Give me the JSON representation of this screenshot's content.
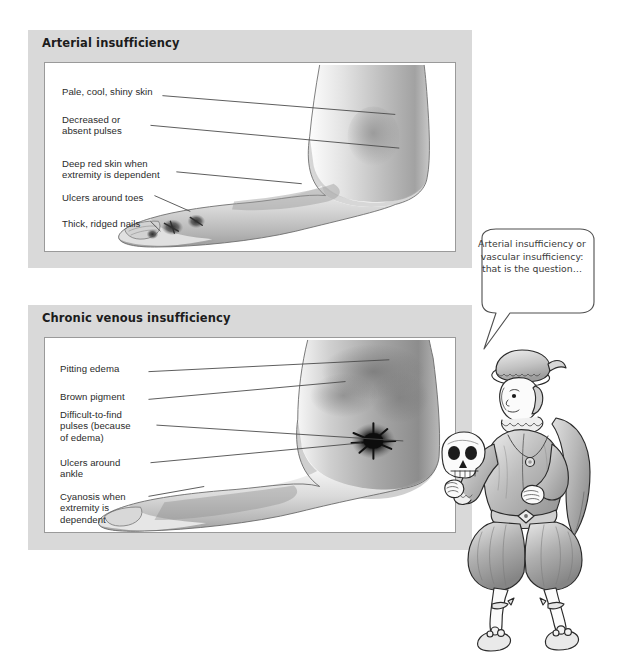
{
  "page": {
    "background_color": "#ffffff",
    "panel_frame_color": "#d9d9d9",
    "panel_body_color": "#ffffff",
    "leader_line_color": "#4a4a4a"
  },
  "panels": [
    {
      "id": "arterial",
      "title": "Arterial insufficiency",
      "labels": [
        {
          "name": "pale-cool-shiny-skin",
          "text": "Pale, cool, shiny skin"
        },
        {
          "name": "decreased-or-absent-pulses",
          "text": "Decreased or\nabsent pulses"
        },
        {
          "name": "deep-red-skin-when-extremity-is-dependent",
          "text": "Deep red skin when\nextremity is dependent"
        },
        {
          "name": "ulcers-around-toes",
          "text": "Ulcers around toes"
        },
        {
          "name": "thick-ridged-nails",
          "text": "Thick, ridged nails"
        }
      ],
      "illustration": "lateral view of foot and lower leg, grayscale shaded, showing toe ulcers and ridged nails"
    },
    {
      "id": "venous",
      "title": "Chronic venous insufficiency",
      "labels": [
        {
          "name": "pitting-edema",
          "text": "Pitting edema"
        },
        {
          "name": "brown-pigment",
          "text": "Brown pigment"
        },
        {
          "name": "difficult-to-find-pulses",
          "text": "Difficult-to-find\npulses (because\nof edema)"
        },
        {
          "name": "ulcers-around-ankle",
          "text": "Ulcers around\nankle"
        },
        {
          "name": "cyanosis-when-extremity-is-dependent",
          "text": "Cyanosis when\nextremity is\ndependent"
        }
      ],
      "illustration": "lateral view of edematous foot and lower leg, grayscale shaded, with dark ulcer patch at the ankle"
    }
  ],
  "speech_bubble": {
    "name": "speech-bubble",
    "text": "Arterial\ninsufficiency or\nvascular\ninsufficiency: that\nis the question…"
  },
  "character": {
    "name": "hamlet-figure",
    "description": "cartoon Hamlet in Elizabethan doublet, puffed breeches, cape and plumed cap, holding a skull in his raised right hand"
  }
}
